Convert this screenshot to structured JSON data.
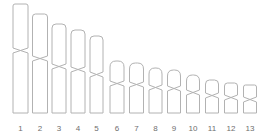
{
  "figure": {
    "kind": "karyotype-idiogram",
    "background_color": "#ffffff",
    "outline_color": "#b2b2b2",
    "fill_color": "#ffffff",
    "label_color": "#6e6e6e",
    "baseline_y": 113,
    "label_baseline_y": 131
  },
  "chart_data": {
    "type": "bar",
    "xlabel": "",
    "ylabel": "",
    "categories": [
      "1",
      "2",
      "3",
      "4",
      "5",
      "6",
      "7",
      "8",
      "9",
      "10",
      "11",
      "12",
      "13"
    ],
    "values": [
      109,
      99,
      89,
      83,
      77,
      52,
      50,
      45,
      43,
      38,
      33,
      30,
      28
    ],
    "series": [
      {
        "name": "total length (px)",
        "values": [
          109,
          99,
          89,
          83,
          77,
          52,
          50,
          45,
          43,
          38,
          33,
          30,
          28
        ]
      },
      {
        "name": "short arm length (px)",
        "values": [
          44,
          42,
          40,
          37,
          36,
          20,
          19,
          17,
          16,
          15,
          13,
          12,
          12
        ]
      },
      {
        "name": "long arm length (px)",
        "values": [
          60,
          52,
          44,
          41,
          36,
          27,
          26,
          23,
          22,
          18,
          15,
          13,
          11
        ]
      },
      {
        "name": "width (px)",
        "values": [
          15,
          15,
          14,
          14,
          13,
          14,
          14,
          13,
          13,
          13,
          13,
          13,
          13
        ]
      }
    ],
    "grid": false,
    "legend_position": "none"
  },
  "chromosomes": [
    {
      "id": "1",
      "label": "1",
      "cx": 20.5,
      "width": 15,
      "top": 4,
      "bottom": 113,
      "cen_top": 48,
      "cen_bottom": 53,
      "cap": 2
    },
    {
      "id": "2",
      "label": "2",
      "cx": 40.0,
      "width": 15,
      "top": 14,
      "bottom": 113,
      "cen_top": 56,
      "cen_bottom": 61,
      "cap": 3
    },
    {
      "id": "3",
      "label": "3",
      "cx": 59.0,
      "width": 14,
      "top": 24,
      "bottom": 113,
      "cen_top": 64,
      "cen_bottom": 69,
      "cap": 4
    },
    {
      "id": "4",
      "label": "4",
      "cx": 78.0,
      "width": 14,
      "top": 30,
      "bottom": 113,
      "cen_top": 67,
      "cen_bottom": 72,
      "cap": 4
    },
    {
      "id": "5",
      "label": "5",
      "cx": 96.5,
      "width": 13,
      "top": 36,
      "bottom": 113,
      "cen_top": 72,
      "cen_bottom": 77,
      "cap": 4
    },
    {
      "id": "6",
      "label": "6",
      "cx": 117.0,
      "width": 14,
      "top": 61,
      "bottom": 113,
      "cen_top": 81,
      "cen_bottom": 86,
      "cap": 6
    },
    {
      "id": "7",
      "label": "7",
      "cx": 136.5,
      "width": 14,
      "top": 63,
      "bottom": 113,
      "cen_top": 82,
      "cen_bottom": 87,
      "cap": 6
    },
    {
      "id": "8",
      "label": "8",
      "cx": 155.5,
      "width": 13,
      "top": 68,
      "bottom": 113,
      "cen_top": 85,
      "cen_bottom": 90,
      "cap": 6
    },
    {
      "id": "9",
      "label": "9",
      "cx": 174.0,
      "width": 13,
      "top": 70,
      "bottom": 113,
      "cen_top": 86,
      "cen_bottom": 91,
      "cap": 6
    },
    {
      "id": "10",
      "label": "10",
      "cx": 193.0,
      "width": 13,
      "top": 75,
      "bottom": 113,
      "cen_top": 90,
      "cen_bottom": 95,
      "cap": 6
    },
    {
      "id": "11",
      "label": "11",
      "cx": 212.0,
      "width": 13,
      "top": 80,
      "bottom": 113,
      "cen_top": 93,
      "cen_bottom": 98,
      "cap": 4
    },
    {
      "id": "12",
      "label": "12",
      "cx": 231.0,
      "width": 13,
      "top": 83,
      "bottom": 113,
      "cen_top": 95,
      "cen_bottom": 100,
      "cap": 3
    },
    {
      "id": "13",
      "label": "13",
      "cx": 250.0,
      "width": 13,
      "top": 85,
      "bottom": 113,
      "cen_top": 97,
      "cen_bottom": 102,
      "cap": 2
    }
  ]
}
